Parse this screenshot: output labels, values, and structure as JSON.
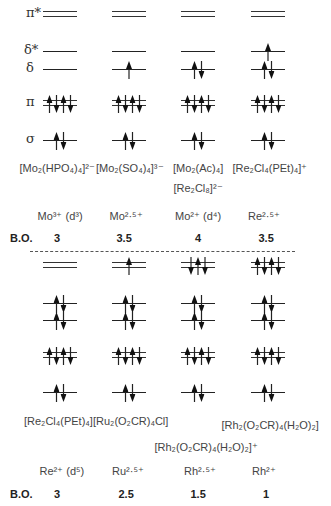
{
  "level_labels": [
    "π*",
    "δ*",
    "δ",
    "π",
    "σ"
  ],
  "bond_order_label": "B.O.",
  "top": {
    "columns": [
      {
        "complex": "[Mo₂(HPO₄)₄]²⁻",
        "ion": "Mo³⁺ (d³)",
        "bond_order": "3",
        "filling": {
          "pi_star": "",
          "delta_star": "",
          "delta": "",
          "pi": "↑↓↑↓",
          "sigma": "↑↓"
        }
      },
      {
        "complex": "[Mo₂(SO₄)₄]³⁻",
        "ion": "Mo²·⁵⁺",
        "bond_order": "3.5",
        "filling": {
          "pi_star": "",
          "delta_star": "",
          "delta": "↑",
          "pi": "↑↓↑↓",
          "sigma": "↑↓"
        }
      },
      {
        "complex": "[Mo₂(Ac)₄]",
        "complex2": "[Re₂Cl₈]²⁻",
        "ion": "Mo²⁺ (d⁴)",
        "bond_order": "4",
        "filling": {
          "pi_star": "",
          "delta_star": "",
          "delta": "↑↓",
          "pi": "↑↓↑↓",
          "sigma": "↑↓"
        }
      },
      {
        "complex": "[Re₂Cl₄(PEt)₄]⁺",
        "ion": "Re²·⁵⁺",
        "bond_order": "3.5",
        "filling": {
          "pi_star": "",
          "delta_star": "↑",
          "delta": "↑↓",
          "pi": "↑↓↑↓",
          "sigma": "↑↓"
        }
      }
    ]
  },
  "bottom": {
    "columns": [
      {
        "complex": "[Re₂Cl₄(PEt)₄]",
        "ion": "Re²⁺ (d⁵)",
        "bond_order": "3",
        "filling": {
          "pi_star": "",
          "delta_star": "↑↓",
          "delta": "↑↓",
          "pi": "↑↓↑↓",
          "sigma": "↑↓"
        }
      },
      {
        "complex": "[Ru₂(O₂CR)₄Cl]",
        "ion": "Ru²·⁵⁺",
        "bond_order": "2.5",
        "filling": {
          "pi_star": "↑",
          "delta_star": "↑↓",
          "delta": "↑↓",
          "pi": "↑↓↑↓",
          "sigma": "↑↓"
        }
      },
      {
        "complex": "[Rh₂(O₂CR)₄(H₂O)₂]⁺",
        "ion": "Rh²·⁵⁺",
        "bond_order": "1.5",
        "filling": {
          "pi_star": "↓↑↓",
          "delta_star": "↑↓",
          "delta": "↑↓",
          "pi": "↑↓↑↓",
          "sigma": "↑↓"
        }
      },
      {
        "complex": "[Rh₂(O₂CR)₄(H₂O)₂]",
        "ion": "Rh²⁺",
        "bond_order": "1",
        "filling": {
          "pi_star": "↑↓↑↓",
          "delta_star": "↑↓",
          "delta": "↑↓",
          "pi": "↑↓↑↓",
          "sigma": "↑↓"
        }
      }
    ]
  }
}
